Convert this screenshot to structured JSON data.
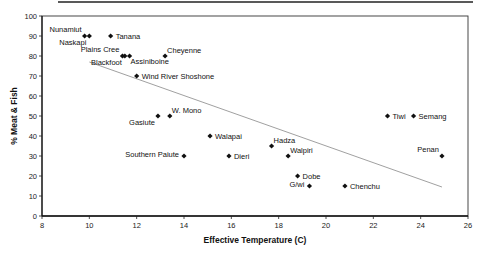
{
  "chart_data": {
    "type": "scatter",
    "title": "",
    "xlabel": "Effective Temperature (C)",
    "ylabel": "% Meat & Fish",
    "xlim": [
      8,
      26
    ],
    "ylim": [
      0,
      100
    ],
    "xticks": [
      8,
      10,
      12,
      14,
      16,
      18,
      20,
      22,
      24,
      26
    ],
    "yticks": [
      0,
      10,
      20,
      30,
      40,
      50,
      60,
      70,
      80,
      90,
      100
    ],
    "grid": false,
    "legend": "none",
    "marker": "diamond",
    "points": [
      {
        "label": "Nunamiut",
        "x": 9.8,
        "y": 90,
        "label_pos": "upper-left"
      },
      {
        "label": "Naskapi",
        "x": 10.0,
        "y": 90,
        "label_pos": "below-left"
      },
      {
        "label": "Tanana",
        "x": 10.9,
        "y": 90,
        "label_pos": "right"
      },
      {
        "label": "Plains Cree",
        "x": 11.4,
        "y": 80,
        "label_pos": "upper-left"
      },
      {
        "label": "Blackfoot",
        "x": 11.5,
        "y": 80,
        "label_pos": "below-left"
      },
      {
        "label": "Assiniboine",
        "x": 11.7,
        "y": 80,
        "label_pos": "below-right"
      },
      {
        "label": "Cheyenne",
        "x": 13.2,
        "y": 80,
        "label_pos": "upper-right"
      },
      {
        "label": "Wind River Shoshone",
        "x": 12.0,
        "y": 70,
        "label_pos": "right"
      },
      {
        "label": "Gasiute",
        "x": 12.9,
        "y": 50,
        "label_pos": "below-left"
      },
      {
        "label": "W. Mono",
        "x": 13.4,
        "y": 50,
        "label_pos": "upper-right"
      },
      {
        "label": "Walapai",
        "x": 15.1,
        "y": 40,
        "label_pos": "right"
      },
      {
        "label": "Southern Paiute",
        "x": 14.0,
        "y": 30,
        "label_pos": "left"
      },
      {
        "label": "Dieri",
        "x": 15.9,
        "y": 30,
        "label_pos": "right"
      },
      {
        "label": "Hadza",
        "x": 17.7,
        "y": 35,
        "label_pos": "upper-right"
      },
      {
        "label": "Walpiri",
        "x": 18.4,
        "y": 30,
        "label_pos": "upper-right"
      },
      {
        "label": "Dobe",
        "x": 18.8,
        "y": 20,
        "label_pos": "right"
      },
      {
        "label": "G/wi",
        "x": 19.3,
        "y": 15,
        "label_pos": "left"
      },
      {
        "label": "Chenchu",
        "x": 20.8,
        "y": 15,
        "label_pos": "right"
      },
      {
        "label": "Tiwi",
        "x": 22.6,
        "y": 50,
        "label_pos": "right"
      },
      {
        "label": "Semang",
        "x": 23.7,
        "y": 50,
        "label_pos": "right"
      },
      {
        "label": "Penan",
        "x": 24.9,
        "y": 30,
        "label_pos": "upper-left"
      }
    ],
    "trendline": {
      "type": "linear",
      "x": [
        10.0,
        24.9
      ],
      "y": [
        77,
        14.5
      ]
    }
  }
}
